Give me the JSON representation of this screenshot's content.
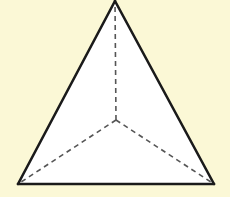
{
  "figure": {
    "type": "tetrahedron-top-view",
    "colors": {
      "background": "#fbf8d6",
      "face_fill": "#ffffff",
      "edge_stroke": "#1a1a1a",
      "hidden_edge_stroke": "#555555"
    },
    "vertices": {
      "top": [
        115,
        1
      ],
      "bottom_left": [
        18,
        184
      ],
      "bottom_right": [
        214,
        184
      ],
      "center": [
        116,
        120
      ]
    },
    "solid_edges": [
      [
        "top",
        "bottom_left"
      ],
      [
        "top",
        "bottom_right"
      ],
      [
        "bottom_left",
        "bottom_right"
      ]
    ],
    "dashed_edges": [
      [
        "center",
        "top"
      ],
      [
        "center",
        "bottom_left"
      ],
      [
        "center",
        "bottom_right"
      ]
    ]
  }
}
